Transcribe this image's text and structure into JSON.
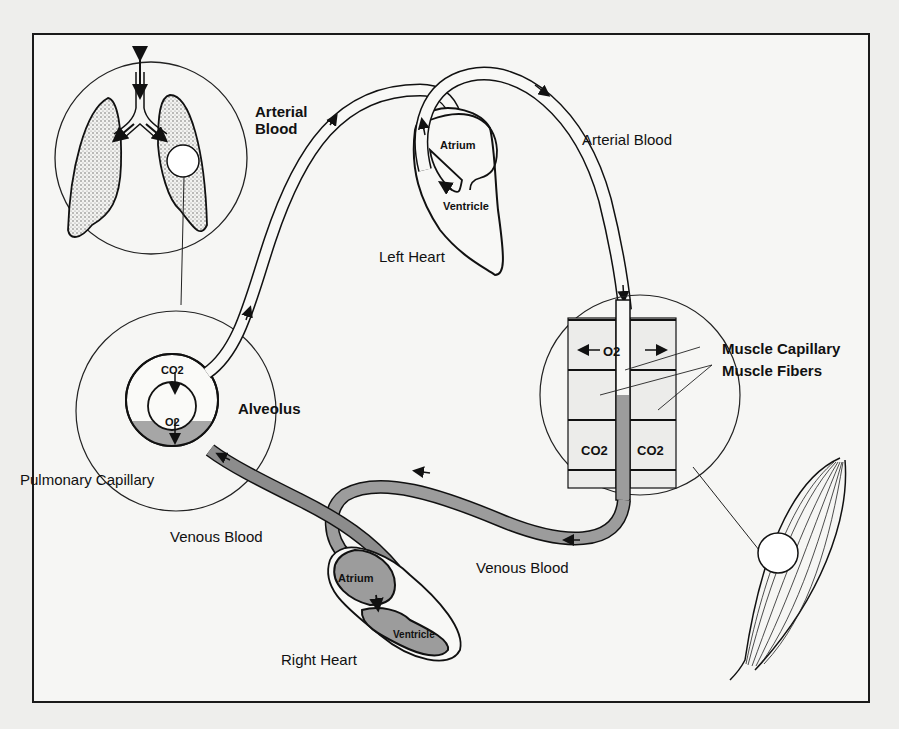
{
  "diagram": {
    "labels": {
      "arterial_blood_left": "Arterial\nBlood",
      "arterial_blood_left_line1": "Arterial",
      "arterial_blood_left_line2": "Blood",
      "arterial_blood_right": "Arterial Blood",
      "left_heart": "Left Heart",
      "left_atrium": "Atrium",
      "left_ventricle": "Ventricle",
      "muscle_capillary": "Muscle Capillary",
      "muscle_fibers": "Muscle Fibers",
      "alveolus": "Alveolus",
      "pulmonary_capillary": "Pulmonary Capillary",
      "venous_blood_left": "Venous Blood",
      "venous_blood_right": "Venous Blood",
      "right_heart": "Right Heart",
      "right_atrium": "Atrium",
      "right_ventricle": "Ventricle",
      "alveolus_co2": "CO2",
      "alveolus_o2": "O2",
      "muscle_o2": "O2",
      "muscle_co2_left": "CO2",
      "muscle_co2_right": "CO2"
    },
    "components": [
      "lungs-inset",
      "alveolus-inset",
      "left-heart",
      "right-heart",
      "muscle-capillary-inset",
      "whole-muscle"
    ],
    "colors": {
      "background": "#eeeeec",
      "line": "#111111",
      "venous_fill": "#9a9a9a",
      "lung_stipple": "#b8b8b8"
    }
  }
}
